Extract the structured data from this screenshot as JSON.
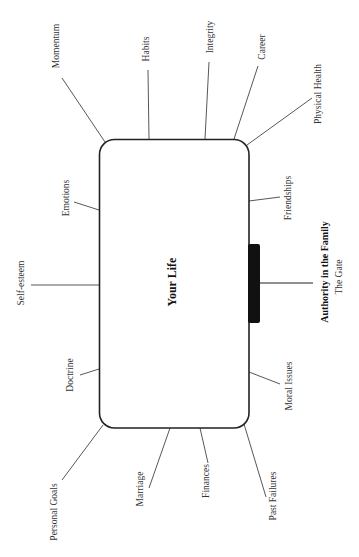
{
  "diagram": {
    "center": {
      "label": "Your Life"
    },
    "gate": {
      "title": "Authority in the Family",
      "subtitle": "The Gate"
    },
    "spokes": [
      {
        "label": "Momentum"
      },
      {
        "label": "Habits"
      },
      {
        "label": "Integrity"
      },
      {
        "label": "Career"
      },
      {
        "label": "Physical Health"
      },
      {
        "label": "Emotions"
      },
      {
        "label": "Friendships"
      },
      {
        "label": "Self-esteem"
      },
      {
        "label": "Doctrine"
      },
      {
        "label": "Moral Issues"
      },
      {
        "label": "Personal Goals"
      },
      {
        "label": "Marriage"
      },
      {
        "label": "Finances"
      },
      {
        "label": "Past Failures"
      }
    ],
    "colors": {
      "line": "#444444",
      "box_stroke": "#222222",
      "gate_fill": "#111111",
      "text": "#333333"
    }
  }
}
